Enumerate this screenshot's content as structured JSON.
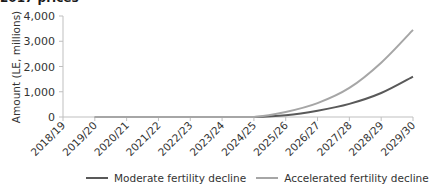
{
  "header": {
    "title_fragment": "2017 prices"
  },
  "chart_data": {
    "type": "line",
    "title": "2017 prices",
    "xlabel": "",
    "ylabel": "Amount (LE, millions)",
    "ylim": [
      0,
      4000
    ],
    "yticks": [
      0,
      1000,
      2000,
      3000,
      4000
    ],
    "ytick_labels": [
      "0",
      "1,000",
      "2,000",
      "3,000",
      "4,000"
    ],
    "grid": false,
    "legend_position": "bottom",
    "categories": [
      "2018/19",
      "2019/20",
      "2020/21",
      "2021/22",
      "2022/23",
      "2023/24",
      "2024/25",
      "2025/26",
      "2026/27",
      "2027/28",
      "2028/29",
      "2029/30"
    ],
    "series": [
      {
        "name": "Moderate fertility decline",
        "color": "#595959",
        "values": [
          null,
          0,
          0,
          0,
          0,
          0,
          0,
          70,
          250,
          520,
          950,
          1600
        ]
      },
      {
        "name": "Accelerated fertility decline",
        "color": "#a6a6a6",
        "values": [
          null,
          0,
          0,
          0,
          0,
          0,
          0,
          200,
          550,
          1150,
          2150,
          3450
        ]
      }
    ]
  },
  "legend": {
    "items": [
      {
        "label": "Moderate fertility decline",
        "color": "#595959"
      },
      {
        "label": "Accelerated fertility decline",
        "color": "#a6a6a6"
      }
    ]
  }
}
